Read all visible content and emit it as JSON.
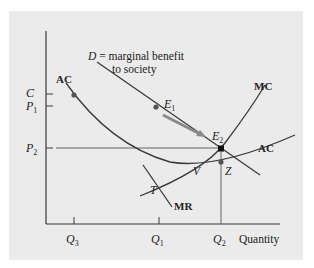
{
  "figure": {
    "background": "#ebebeb",
    "axes": {
      "x_label": "Quantity",
      "x_ticks": [
        {
          "label": "Q",
          "sub": "3",
          "x": 74
        },
        {
          "label": "Q",
          "sub": "1",
          "x": 159
        },
        {
          "label": "Q",
          "sub": "2",
          "x": 221
        }
      ],
      "y_ticks": [
        {
          "label": "C",
          "sub": "",
          "y": 94
        },
        {
          "label": "P",
          "sub": "1",
          "y": 106
        },
        {
          "label": "P",
          "sub": "2",
          "y": 148
        }
      ]
    },
    "curves": {
      "demand_label_main": "D",
      "demand_label_rest": " = marginal benefit",
      "demand_label_line2": "to society",
      "ac_left_label": "AC",
      "ac_right_label": "AC",
      "mc_label": "MC",
      "mr_label": "MR"
    },
    "points": {
      "E1": {
        "label": "E",
        "sub": "1"
      },
      "E2": {
        "label": "E",
        "sub": "2"
      },
      "V": {
        "label": "V"
      },
      "Z": {
        "label": "Z"
      },
      "T": {
        "label": "T"
      }
    },
    "colors": {
      "line": "#3a3a3a",
      "arrow": "#8a8a8a",
      "dot": "#555555",
      "e2_dot": "#111111"
    }
  }
}
